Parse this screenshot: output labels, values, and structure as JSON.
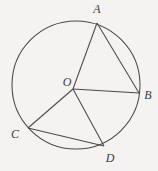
{
  "figure": {
    "background_color": "#f4f3f1",
    "stroke_color": "#4a4a4a",
    "label_color": "#3a3a3a",
    "circle": {
      "center_x": 76,
      "center_y": 85,
      "radius": 64,
      "label": "circle"
    },
    "points": [
      {
        "id": "O",
        "label": "O",
        "x": 73,
        "y": 89,
        "label_x": 67,
        "label_y": 82,
        "role": "center"
      },
      {
        "id": "A",
        "label": "A",
        "x": 97,
        "y": 23,
        "label_x": 97,
        "label_y": 9,
        "role": "on-circle"
      },
      {
        "id": "B",
        "label": "B",
        "x": 139,
        "y": 93,
        "label_x": 148,
        "label_y": 95,
        "role": "on-circle"
      },
      {
        "id": "C",
        "label": "C",
        "x": 28,
        "y": 128,
        "label_x": 15,
        "label_y": 134,
        "role": "on-circle"
      },
      {
        "id": "D",
        "label": "D",
        "x": 104,
        "y": 146,
        "label_x": 110,
        "label_y": 158,
        "role": "on-circle"
      }
    ],
    "segments": [
      {
        "id": "OA",
        "from": "O",
        "to": "A",
        "kind": "radius"
      },
      {
        "id": "OB",
        "from": "O",
        "to": "B",
        "kind": "radius"
      },
      {
        "id": "OC",
        "from": "O",
        "to": "C",
        "kind": "radius"
      },
      {
        "id": "OD",
        "from": "O",
        "to": "D",
        "kind": "radius"
      },
      {
        "id": "AB",
        "from": "A",
        "to": "B",
        "kind": "chord"
      },
      {
        "id": "CD",
        "from": "C",
        "to": "D",
        "kind": "chord"
      }
    ]
  }
}
